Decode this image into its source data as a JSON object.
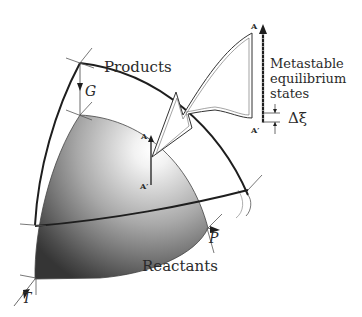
{
  "diagram": {
    "labels": {
      "products": "Products",
      "reactants": "Reactants",
      "gibbs": "G",
      "pressure": "P",
      "temperature": "T",
      "metastable_line1": "Metastable",
      "metastable_line2": "equilibrium",
      "metastable_line3": "states",
      "delta_xi": "Δξ",
      "point_a_small": "A",
      "point_a_prime_small": "A′",
      "point_a_large": "A",
      "point_a_prime_large": "A′"
    },
    "colors": {
      "line": "#1e1e1e",
      "shade_dark": "#3a3a3a",
      "shade_light": "#ffffff"
    }
  }
}
